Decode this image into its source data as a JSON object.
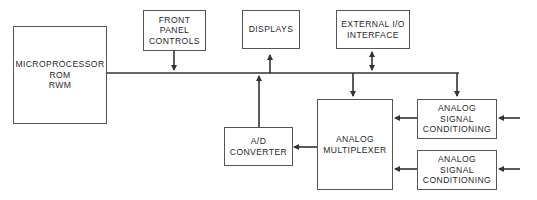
{
  "diagram": {
    "type": "block-diagram",
    "blocks": {
      "microprocessor": {
        "lines": [
          "MICROPROCESSOR",
          "ROM",
          "RWM"
        ]
      },
      "front_panel": {
        "lines": [
          "FRONT",
          "PANEL",
          "CONTROLS"
        ]
      },
      "displays": {
        "lines": [
          "DISPLAYS"
        ]
      },
      "external_io": {
        "lines": [
          "EXTERNAL I/O",
          "INTERFACE"
        ]
      },
      "ad_converter": {
        "lines": [
          "A/D",
          "CONVERTER"
        ]
      },
      "multiplexer": {
        "lines": [
          "ANALOG",
          "MULTIPLEXER"
        ]
      },
      "signal_cond_1": {
        "lines": [
          "ANALOG",
          "SIGNAL",
          "CONDITIONING"
        ]
      },
      "signal_cond_2": {
        "lines": [
          "ANALOG",
          "SIGNAL",
          "CONDITIONING"
        ]
      }
    },
    "connections": [
      {
        "from": "microprocessor",
        "to": "bus",
        "arrow": "none"
      },
      {
        "from": "front_panel",
        "to": "bus",
        "arrow": "down"
      },
      {
        "from": "bus",
        "to": "displays",
        "arrow": "up"
      },
      {
        "from": "external_io",
        "to": "bus",
        "arrow": "bidirectional"
      },
      {
        "from": "ad_converter",
        "to": "bus",
        "arrow": "up"
      },
      {
        "from": "bus",
        "to": "multiplexer",
        "arrow": "down"
      },
      {
        "from": "bus",
        "to": "signal_cond_1",
        "arrow": "down"
      },
      {
        "from": "multiplexer",
        "to": "ad_converter",
        "arrow": "left"
      },
      {
        "from": "signal_cond_1",
        "to": "multiplexer",
        "arrow": "left"
      },
      {
        "from": "signal_cond_2",
        "to": "multiplexer",
        "arrow": "left"
      },
      {
        "from": "external_input_1",
        "to": "signal_cond_1",
        "arrow": "left"
      },
      {
        "from": "external_input_2",
        "to": "signal_cond_2",
        "arrow": "left"
      }
    ]
  }
}
